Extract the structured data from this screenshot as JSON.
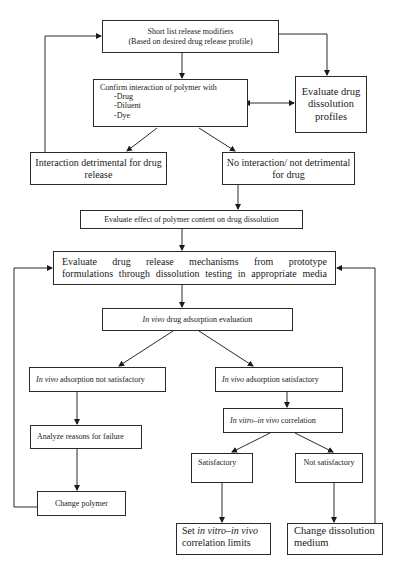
{
  "diagram": {
    "nodes": {
      "shortlist": {
        "line1": "Short list release modifiers",
        "line2": "(Based on desired drug release profile)"
      },
      "confirm": {
        "title": "Confirm interaction of polymer with",
        "items": [
          "-Drug",
          "-Diluent",
          "-Dye"
        ]
      },
      "evaluate_profiles": {
        "text": "Evaluate drug dissolution profiles"
      },
      "detrimental": {
        "text": "Interaction detrimental for drug release"
      },
      "no_interaction": {
        "text": "No interaction/ not detrimental for drug"
      },
      "polymer_content": {
        "text": "Evaluate effect of polymer content on drug dissolution"
      },
      "mechanisms": {
        "line1": "Evaluate drug release mechanisms from prototype",
        "line2": "formulations through dissolution testing in appropriate media"
      },
      "invivo_eval": {
        "italic": "In vivo",
        "rest": " drug adsorption evaluation"
      },
      "invivo_not_sat": {
        "italic": "In vivo",
        "rest": " adsorption not satisfactory"
      },
      "invivo_sat": {
        "italic": "In vivo",
        "rest": " adsorption satisfactory"
      },
      "analyze": {
        "text": "Analyze reasons for failure"
      },
      "ivivc": {
        "italic": "In vitro–in vivo",
        "rest": " correlation"
      },
      "satisfactory": {
        "text": "Satisfactory"
      },
      "not_satisfactory": {
        "text": "Not satisfactory"
      },
      "change_polymer": {
        "text": "Change polymer"
      },
      "set_limits": {
        "pre": "Set ",
        "italic": "in vitro–in vivo",
        "post": "correlation limits"
      },
      "change_medium": {
        "line1": "Change dissolution",
        "line2": "medium"
      }
    },
    "edges": [
      [
        "shortlist",
        "confirm"
      ],
      [
        "shortlist",
        "evaluate_profiles"
      ],
      [
        "confirm",
        "evaluate_profiles",
        "bidirectional"
      ],
      [
        "confirm",
        "detrimental"
      ],
      [
        "confirm",
        "no_interaction"
      ],
      [
        "detrimental",
        "shortlist"
      ],
      [
        "no_interaction",
        "polymer_content"
      ],
      [
        "polymer_content",
        "mechanisms"
      ],
      [
        "mechanisms",
        "invivo_eval"
      ],
      [
        "invivo_eval",
        "invivo_not_sat"
      ],
      [
        "invivo_eval",
        "invivo_sat"
      ],
      [
        "invivo_not_sat",
        "analyze"
      ],
      [
        "analyze",
        "change_polymer"
      ],
      [
        "change_polymer",
        "mechanisms"
      ],
      [
        "invivo_sat",
        "ivivc"
      ],
      [
        "ivivc",
        "satisfactory"
      ],
      [
        "ivivc",
        "not_satisfactory"
      ],
      [
        "satisfactory",
        "set_limits"
      ],
      [
        "not_satisfactory",
        "change_medium"
      ],
      [
        "change_medium",
        "mechanisms"
      ]
    ]
  }
}
